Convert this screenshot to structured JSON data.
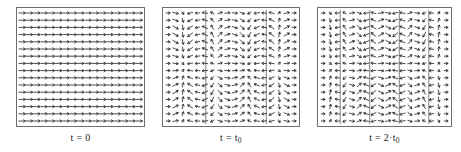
{
  "figure": {
    "background_color": "#ffffff",
    "frame_color": "#6d6d6d",
    "arrow_color": "#2a2a2a",
    "panel_count": 3
  },
  "panels": [
    {
      "id": "panel-t0",
      "caption_prefix": "t = ",
      "caption_value": "0",
      "caption_sub": "",
      "caption_full": "t = 0",
      "frame": {
        "x": 16,
        "y": 7,
        "width": 129,
        "height": 120
      },
      "description": "uniform horizontal vector field, all arrows point right",
      "grid": {
        "cols": 17,
        "rows": 16
      },
      "field_type": "uniform",
      "zone_count": 0
    },
    {
      "id": "panel-t-t0",
      "caption_prefix": "t = ",
      "caption_value": "t",
      "caption_sub": "0",
      "caption_full": "t = t0",
      "frame": {
        "x": 162,
        "y": 7,
        "width": 138,
        "height": 120
      },
      "description": "vector field with two convergence sheets, arrows converge toward vertical lines",
      "grid": {
        "cols": 18,
        "rows": 16
      },
      "field_type": "converging",
      "zone_count": 2,
      "zone_positions": [
        0.3,
        0.78
      ]
    },
    {
      "id": "panel-t-2t0",
      "caption_prefix": "t = ",
      "caption_value": "2·t",
      "caption_sub": "0",
      "caption_full": "t = 2·t0",
      "frame": {
        "x": 317,
        "y": 7,
        "width": 135,
        "height": 120
      },
      "description": "vector field with four convergence sheets, more developed filamentation",
      "grid": {
        "cols": 18,
        "rows": 16
      },
      "field_type": "converging",
      "zone_count": 4,
      "zone_positions": [
        0.14,
        0.38,
        0.62,
        0.86
      ]
    }
  ],
  "chart_data": {
    "type": "quiver",
    "title": "",
    "xlabel": "",
    "ylabel": "",
    "series": [
      {
        "name": "t = 0",
        "panel": 0,
        "u_description": "u = 1 everywhere (uniform rightward flow)",
        "v_description": "v = 0 everywhere",
        "amplitude": 0.0,
        "wavenumber": 0,
        "cols": 17,
        "rows": 16
      },
      {
        "name": "t = t0",
        "panel": 1,
        "u_description": "u = cos(pi*x) modulated, converging toward x = 0.30 and x = 0.78",
        "v_description": "v = small vertical shear component",
        "amplitude": 1.0,
        "wavenumber": 2,
        "cols": 18,
        "rows": 16
      },
      {
        "name": "t = 2·t0",
        "panel": 2,
        "u_description": "u = cos(2*pi*x) modulated, converging toward four sheets",
        "v_description": "v = stronger vertical shear component",
        "amplitude": 1.0,
        "wavenumber": 4,
        "cols": 18,
        "rows": 16
      }
    ],
    "xlim": [
      0,
      1
    ],
    "ylim": [
      0,
      1
    ],
    "grid": false,
    "legend": "none"
  }
}
